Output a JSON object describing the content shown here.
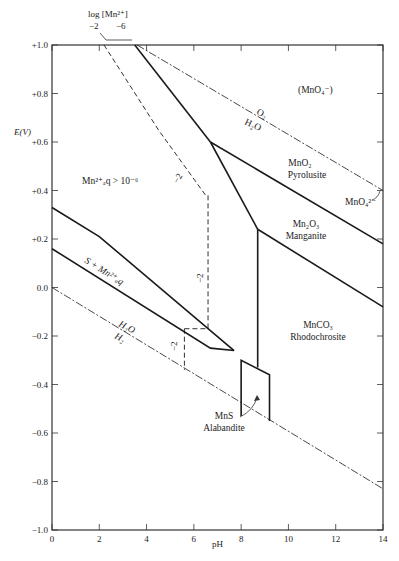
{
  "chart_data": {
    "type": "line",
    "xlabel": "pH",
    "ylabel": "E(V)",
    "xlim": [
      0,
      14
    ],
    "ylim": [
      -1.0,
      1.0
    ],
    "x_ticks": [
      0,
      2,
      4,
      6,
      8,
      10,
      12,
      14
    ],
    "x_tick_labels": [
      "0",
      "2",
      "4",
      "6",
      "8",
      "10",
      "12",
      "14"
    ],
    "y_ticks": [
      1.0,
      0.8,
      0.6,
      0.4,
      0.2,
      0.0,
      -0.2,
      -0.4,
      -0.6,
      -0.8,
      -1.0
    ],
    "y_tick_labels": [
      "+1.0",
      "+0.8",
      "+0.6",
      "+0.4",
      "+0.2",
      "0.0",
      "−0.2",
      "−0.4",
      "−0.6",
      "−0.8",
      "−1.0"
    ],
    "grid": false,
    "legend": {
      "title": "log [Mn²⁺]",
      "entries": [
        "−2",
        "−6"
      ]
    },
    "series": [
      {
        "name": "O2/H2O boundary",
        "style": "dash-dot",
        "points": [
          [
            3.6,
            1.0
          ],
          [
            14,
            0.4
          ]
        ]
      },
      {
        "name": "H2O/H2 boundary",
        "style": "dash-dot",
        "points": [
          [
            0,
            0.0
          ],
          [
            14,
            -0.83
          ]
        ]
      },
      {
        "name": "Mn2+/MnO2 (log -6)",
        "style": "solid",
        "points": [
          [
            3.5,
            1.0
          ],
          [
            6.7,
            0.6
          ]
        ]
      },
      {
        "name": "MnO2/Mn2O3",
        "style": "solid",
        "points": [
          [
            6.7,
            0.6
          ],
          [
            14,
            0.18
          ]
        ]
      },
      {
        "name": "Mn2+/Mn2O3",
        "style": "solid",
        "points": [
          [
            6.7,
            0.6
          ],
          [
            8.7,
            0.24
          ]
        ]
      },
      {
        "name": "Mn2O3/MnCO3",
        "style": "solid",
        "points": [
          [
            8.7,
            0.24
          ],
          [
            14,
            -0.08
          ]
        ]
      },
      {
        "name": "Mn2+/MnCO3",
        "style": "solid",
        "points": [
          [
            8.7,
            0.24
          ],
          [
            8.7,
            -0.33
          ]
        ]
      },
      {
        "name": "S+Mn2+ upper",
        "style": "solid",
        "points": [
          [
            0,
            0.33
          ],
          [
            2,
            0.21
          ],
          [
            7.7,
            -0.26
          ]
        ]
      },
      {
        "name": "S+Mn2+ lower",
        "style": "solid",
        "points": [
          [
            0,
            0.16
          ],
          [
            6.7,
            -0.25
          ],
          [
            7.7,
            -0.26
          ]
        ]
      },
      {
        "name": "MnS field",
        "style": "solid",
        "points": [
          [
            8.0,
            -0.53
          ],
          [
            8.0,
            -0.3
          ],
          [
            9.2,
            -0.36
          ],
          [
            9.2,
            -0.55
          ]
        ]
      },
      {
        "name": "Mn2+/MnO2 (log -2)",
        "style": "dashed",
        "points": [
          [
            2.2,
            1.0
          ],
          [
            4.5,
            0.65
          ],
          [
            6.5,
            0.38
          ],
          [
            6.6,
            0.38
          ]
        ]
      },
      {
        "name": "log -2 vertical",
        "style": "dashed",
        "points": [
          [
            6.6,
            0.38
          ],
          [
            6.6,
            -0.17
          ]
        ]
      },
      {
        "name": "log -2 horizontal",
        "style": "dashed",
        "points": [
          [
            5.6,
            -0.17
          ],
          [
            6.6,
            -0.17
          ]
        ]
      },
      {
        "name": "log -2 lower vertical",
        "style": "dashed",
        "points": [
          [
            5.6,
            -0.17
          ],
          [
            5.6,
            -0.34
          ]
        ]
      }
    ],
    "annotations": [
      {
        "text": "(MnO₄⁻)",
        "x": 11.5,
        "y": 0.8
      },
      {
        "text": "O₂ / H₂O",
        "x": 8.5,
        "y": 0.65
      },
      {
        "text": "MnO₂ Pyrolusite",
        "x": 10.6,
        "y": 0.47
      },
      {
        "text": "MnO₄²⁻",
        "x": 13.3,
        "y": 0.37
      },
      {
        "text": "Mn₂O₃ Manganite",
        "x": 10.6,
        "y": 0.22
      },
      {
        "text": "Mn²⁺ₐq > 10⁻⁶",
        "x": 2.3,
        "y": 0.43
      },
      {
        "text": "S + Mn²⁺ₐq",
        "x": 2.6,
        "y": 0.08
      },
      {
        "text": "H₂O / H₂",
        "x": 2.6,
        "y": -0.18
      },
      {
        "text": "MnCO₃ Rhodochrosite",
        "x": 10.6,
        "y": -0.16
      },
      {
        "text": "MnS Alabandite",
        "x": 7.6,
        "y": -0.53
      },
      {
        "text": "−2",
        "x": 5.2,
        "y": 0.58
      },
      {
        "text": "−2",
        "x": 6.3,
        "y": -0.04
      },
      {
        "text": "−2",
        "x": 5.3,
        "y": -0.25
      }
    ]
  },
  "labels": {
    "legend_title": "log [Mn²⁺]",
    "legend_a": "−2",
    "legend_b": "−6",
    "ylabel": "E(V)",
    "xlabel": "pH",
    "mno4": "(MnO₄⁻)",
    "o2": "O₂",
    "h2o_top": "H₂O",
    "mno2": "MnO₂",
    "pyrolusite": "Pyrolusite",
    "mno4_2": "MnO₄²⁻",
    "mn2o3": "Mn₂O₃",
    "manganite": "Manganite",
    "mn_aq": "Mn²⁺ₐq > 10⁻⁶",
    "s_mn": "S + Mn²⁺ₐq",
    "h2o_bottom": "H₂O",
    "h2": "H₂",
    "mnco3": "MnCO₃",
    "rhodochrosite": "Rhodochrosite",
    "mns": "MnS",
    "alabandite": "Alabandite",
    "minus2_a": "−2",
    "minus2_b": "−2",
    "minus2_c": "−2"
  }
}
